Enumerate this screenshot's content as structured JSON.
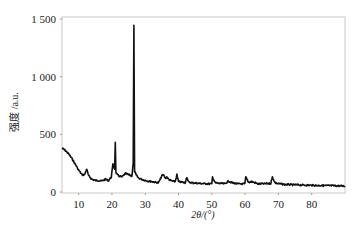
{
  "chart_data": {
    "type": "line",
    "title": "",
    "xlabel": "2θ/(°)",
    "ylabel": "强度 /a.u.",
    "xlim": [
      5,
      90
    ],
    "ylim": [
      0,
      1500
    ],
    "x_ticks": [
      10,
      20,
      30,
      40,
      50,
      60,
      70,
      80
    ],
    "y_ticks": [
      0,
      500,
      1000,
      1500
    ],
    "y_tick_labels": [
      "0",
      "500",
      "1 000",
      "1 500"
    ],
    "grid": false,
    "legend": null,
    "series": [
      {
        "name": "XRD pattern",
        "color": "#111111",
        "x": [
          5,
          6,
          7,
          8,
          9,
          10,
          11,
          11.8,
          12.4,
          13,
          14,
          15,
          16,
          17,
          18,
          19,
          19.8,
          20.3,
          20.8,
          21.0,
          21.2,
          21.6,
          22,
          23,
          24,
          25,
          26,
          26.4,
          26.6,
          26.8,
          27.2,
          28,
          29,
          30,
          31,
          32,
          33,
          34,
          35,
          35.5,
          36,
          36.5,
          37,
          38,
          39,
          39.5,
          40,
          41,
          42,
          42.5,
          43,
          44,
          45,
          46,
          48,
          50,
          50.2,
          51,
          52,
          54,
          55,
          56,
          58,
          59.9,
          60.2,
          61,
          62,
          64,
          66,
          67.7,
          68.2,
          69,
          70,
          72,
          75,
          78,
          80,
          83,
          86,
          90
        ],
        "y": [
          380,
          360,
          330,
          290,
          240,
          190,
          150,
          150,
          200,
          140,
          110,
          100,
          100,
          95,
          110,
          100,
          130,
          240,
          200,
          435,
          170,
          150,
          140,
          130,
          160,
          150,
          140,
          250,
          1440,
          180,
          150,
          120,
          110,
          100,
          95,
          90,
          85,
          80,
          140,
          150,
          120,
          130,
          110,
          95,
          90,
          150,
          90,
          85,
          80,
          130,
          85,
          80,
          78,
          75,
          72,
          70,
          130,
          80,
          75,
          72,
          95,
          80,
          70,
          70,
          130,
          85,
          90,
          70,
          72,
          75,
          130,
          80,
          72,
          65,
          62,
          60,
          58,
          56,
          55,
          52
        ]
      }
    ]
  }
}
